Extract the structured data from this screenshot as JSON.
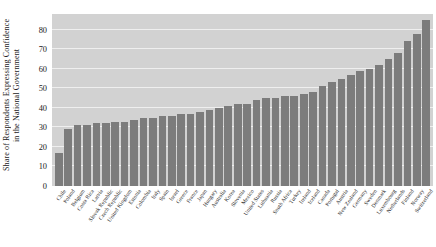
{
  "chart_data": {
    "type": "bar",
    "title": "",
    "xlabel": "",
    "ylabel_line1": "Share of Respondents Expressing Confidence",
    "ylabel_line2": "in the National Government",
    "ylim": [
      0,
      88
    ],
    "yticks": [
      0,
      10,
      20,
      30,
      40,
      50,
      60,
      70,
      80
    ],
    "grid": true,
    "legend": "none",
    "bar_color": "#7c7c7c",
    "plot_background": "#d2d2d2",
    "gridline_color": "#efefef",
    "categories": [
      "Chile",
      "Poland",
      "Belgium",
      "Costa Rica",
      "Latvia",
      "Slovak Republic",
      "Czech Republic",
      "United Kingdom",
      "Estonia",
      "Colombia",
      "Italy",
      "Spain",
      "Israel",
      "Greece",
      "France",
      "Japan",
      "Hungary",
      "Australia",
      "Korea",
      "Slovenia",
      "Mexico",
      "United States",
      "Lithuania",
      "Russia",
      "South Africa",
      "Turkey",
      "Ireland",
      "Iceland",
      "Canada",
      "Portugal",
      "Austria",
      "New Zealand",
      "Germany",
      "Sweden",
      "Denmark",
      "Luxembourg",
      "Netherlands",
      "Finland",
      "Norway",
      "Switzerland"
    ],
    "values": [
      17,
      29,
      31,
      31,
      32,
      32,
      33,
      33,
      34,
      35,
      35,
      36,
      36,
      37,
      37,
      38,
      39,
      40,
      41,
      42,
      42,
      44,
      45,
      45,
      46,
      46,
      47,
      48,
      51,
      53,
      55,
      57,
      59,
      60,
      62,
      65,
      68,
      74,
      78,
      85
    ]
  }
}
